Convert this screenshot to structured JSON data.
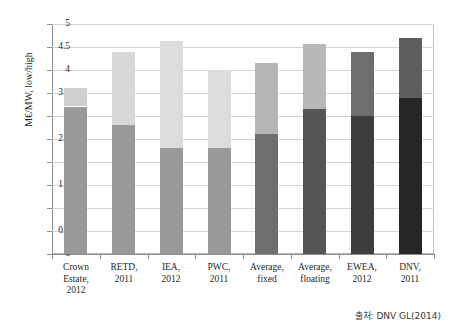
{
  "source_note": "출처: DNV GL(2014)",
  "chart_data": {
    "type": "bar",
    "stacked": true,
    "title": "",
    "subtitle": "",
    "xlabel": "",
    "ylabel": "M€/MW, low/high",
    "ylim": [
      0,
      5
    ],
    "ytick_labels": [
      "0",
      "0.5",
      "1",
      "1.5",
      "2",
      "2.5",
      "3",
      "3.5",
      "4",
      "4.5",
      "5"
    ],
    "ytick_values": [
      0,
      0.5,
      1,
      1.5,
      2,
      2.5,
      3,
      3.5,
      4,
      4.5,
      5
    ],
    "grid": true,
    "legend": "none",
    "categories": [
      "Crown Estate, 2012",
      "RETD, 2011",
      "IEA, 2012",
      "PWC, 2011",
      "Average, fixed",
      "Average, floating",
      "EWEA, 2012",
      "DNV, 2011"
    ],
    "category_lines": [
      [
        "Crown",
        "Estate,",
        "2012"
      ],
      [
        "RETD,",
        "2011"
      ],
      [
        "IEA,",
        "2012"
      ],
      [
        "PWC,",
        "2011"
      ],
      [
        "Average,",
        "fixed"
      ],
      [
        "Average,",
        "floating"
      ],
      [
        "EWEA,",
        "2012"
      ],
      [
        "DNV,",
        "2011"
      ]
    ],
    "series": [
      {
        "name": "low",
        "values": [
          3.2,
          2.8,
          2.3,
          2.3,
          2.6,
          3.15,
          3.0,
          3.4
        ]
      },
      {
        "name": "high",
        "values": [
          3.6,
          4.4,
          4.63,
          4.0,
          4.15,
          4.57,
          4.4,
          4.7
        ]
      }
    ],
    "bar_colors_low": [
      "#9a9a9a",
      "#9a9a9a",
      "#9a9a9a",
      "#9a9a9a",
      "#6e6e6e",
      "#555555",
      "#3d3d3d",
      "#262626"
    ],
    "bar_colors_high": [
      "#cfcfcf",
      "#d8d8d8",
      "#dcdcdc",
      "#dcdcdc",
      "#b5b5b5",
      "#b8b8b8",
      "#6e6e6e",
      "#5e5e5e"
    ]
  }
}
